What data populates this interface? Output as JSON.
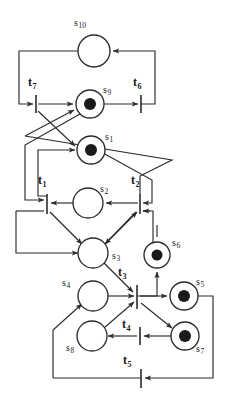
{
  "diagram": {
    "type": "petri-net",
    "title": "",
    "stroke_color": "#2b2b2b",
    "token_color": "#1a1a1a",
    "background": "#ffffff",
    "places": [
      {
        "id": "s10",
        "label": "s",
        "sub": "10",
        "cx": 94,
        "cy": 51,
        "r": 16,
        "tokens": 0,
        "label_x": 74,
        "label_y": 18
      },
      {
        "id": "s9",
        "label": "s",
        "sub": "9",
        "cx": 90,
        "cy": 104,
        "r": 14,
        "tokens": 1,
        "label_x": 103,
        "label_y": 85
      },
      {
        "id": "s1",
        "label": "s",
        "sub": "1",
        "cx": 91,
        "cy": 150,
        "r": 14,
        "tokens": 1,
        "label_x": 105,
        "label_y": 132
      },
      {
        "id": "s2",
        "label": "s",
        "sub": "2",
        "cx": 88,
        "cy": 203,
        "r": 15,
        "tokens": 0,
        "label_x": 100,
        "label_y": 184
      },
      {
        "id": "s3",
        "label": "s",
        "sub": "3",
        "cx": 93,
        "cy": 253,
        "r": 15,
        "tokens": 0,
        "label_x": 112,
        "label_y": 251
      },
      {
        "id": "s6",
        "label": "s",
        "sub": "6",
        "cx": 157,
        "cy": 255,
        "r": 13,
        "tokens": 1,
        "label_x": 172,
        "label_y": 238
      },
      {
        "id": "s4",
        "label": "s",
        "sub": "4",
        "cx": 93,
        "cy": 296,
        "r": 15,
        "tokens": 0,
        "label_x": 62,
        "label_y": 278
      },
      {
        "id": "s5",
        "label": "s",
        "sub": "5",
        "cx": 184,
        "cy": 296,
        "r": 14,
        "tokens": 1,
        "label_x": 196,
        "label_y": 277
      },
      {
        "id": "s8",
        "label": "s",
        "sub": "8",
        "cx": 92,
        "cy": 336,
        "r": 15,
        "tokens": 0,
        "label_x": 66,
        "label_y": 343
      },
      {
        "id": "s7",
        "label": "s",
        "sub": "7",
        "cx": 185,
        "cy": 336,
        "r": 14,
        "tokens": 1,
        "label_x": 196,
        "label_y": 344
      }
    ],
    "transitions": [
      {
        "id": "t7",
        "label": "t",
        "sub": "7",
        "x": 36,
        "y1": 95,
        "y2": 113,
        "label_x": 28,
        "label_y": 76
      },
      {
        "id": "t6",
        "label": "t",
        "sub": "6",
        "x": 141,
        "y1": 95,
        "y2": 113,
        "label_x": 133,
        "label_y": 76
      },
      {
        "id": "t1",
        "label": "t",
        "sub": "1",
        "x": 47,
        "y1": 194,
        "y2": 214,
        "label_x": 38,
        "label_y": 174
      },
      {
        "id": "t2",
        "label": "t",
        "sub": "2",
        "x": 140,
        "y1": 194,
        "y2": 214,
        "label_x": 131,
        "label_y": 174
      },
      {
        "id": "t3",
        "label": "t",
        "sub": "3",
        "x": 137,
        "y1": 285,
        "y2": 309,
        "label_x": 118,
        "label_y": 266
      },
      {
        "id": "t4",
        "label": "t",
        "sub": "4",
        "x": 140,
        "y1": 327,
        "y2": 345,
        "label_x": 122,
        "label_y": 318
      },
      {
        "id": "t5",
        "label": "t",
        "sub": "5",
        "x": 141,
        "y1": 369,
        "y2": 388,
        "label_x": 123,
        "label_y": 354
      }
    ],
    "arcs": [
      {
        "from": "t6",
        "to": "s10"
      },
      {
        "from": "s10",
        "to": "t7"
      },
      {
        "from": "t7",
        "to": "s9"
      },
      {
        "from": "s9",
        "to": "t6"
      },
      {
        "from": "t7",
        "to": "s1"
      },
      {
        "from": "s9",
        "to": "t1"
      },
      {
        "from": "s1",
        "to": "t2"
      },
      {
        "from": "t2",
        "to": "s9"
      },
      {
        "from": "t1",
        "to": "s1"
      },
      {
        "from": "s2",
        "to": "t1"
      },
      {
        "from": "t2",
        "to": "s2"
      },
      {
        "from": "t1",
        "to": "s3"
      },
      {
        "from": "s3",
        "to": "t2"
      },
      {
        "from": "t2",
        "to": "s3"
      },
      {
        "from": "s3",
        "to": "t3"
      },
      {
        "from": "s6",
        "to": "t3"
      },
      {
        "from": "t3",
        "to": "s6"
      },
      {
        "from": "s4",
        "to": "t3"
      },
      {
        "from": "t3",
        "to": "s5"
      },
      {
        "from": "t3",
        "to": "s7"
      },
      {
        "from": "s8",
        "to": "t3"
      },
      {
        "from": "s7",
        "to": "t4"
      },
      {
        "from": "t4",
        "to": "s8"
      },
      {
        "from": "s8",
        "to": "s4"
      },
      {
        "from": "s5",
        "to": "t5"
      },
      {
        "from": "t5",
        "to": "s8"
      }
    ]
  }
}
